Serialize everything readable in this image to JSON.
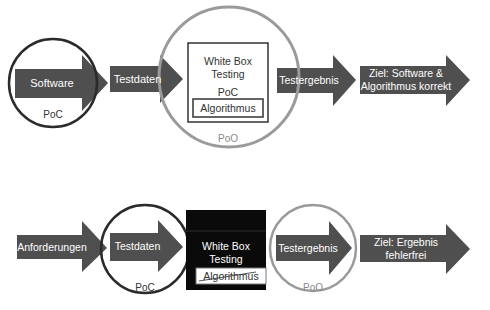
{
  "diagram_top": {
    "software_arrow": "Software",
    "software_circle": "PoC",
    "testdaten_arrow": "Testdaten",
    "whitebox_title_line1": "White Box",
    "whitebox_title_line2": "Testing",
    "whitebox_poc": "PoC",
    "algorithmus": "Algorithmus",
    "big_circle": "PoO",
    "testergebnis_arrow": "Testergebnis",
    "ziel_line1": "Ziel: Software &",
    "ziel_line2": "Algorithmus korrekt"
  },
  "diagram_bottom": {
    "anforderungen_arrow": "Anforderungen",
    "testdaten_arrow": "Testdaten",
    "testdaten_circle": "PoC",
    "whitebox_title_line1": "White Box",
    "whitebox_title_line2": "Testing",
    "algorithmus": "Algorithmus",
    "testergebnis_arrow": "Testergebnis",
    "testergebnis_circle": "PoO",
    "ziel_line1": "Ziel: Ergebnis",
    "ziel_line2": "fehlerfrei"
  },
  "colors": {
    "arrow_fill": "#4f4f4f",
    "poc_circle": "#2b2b2b",
    "poo_circle": "#9a9a9a",
    "blackbox_fill": "#0a0a0a"
  }
}
